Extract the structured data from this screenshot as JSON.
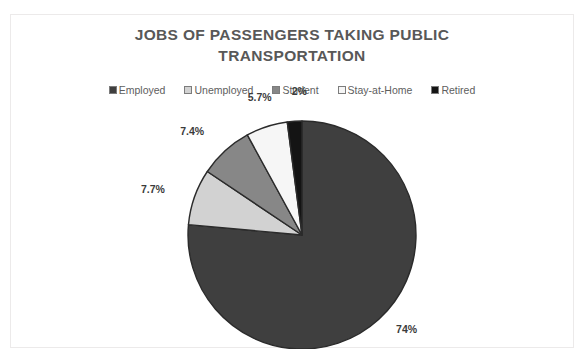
{
  "chart_data": {
    "type": "pie",
    "title": "JOBS OF PASSENGERS TAKING PUBLIC TRANSPORTATION",
    "title_line1": "JOBS OF PASSENGERS TAKING PUBLIC",
    "title_line2": "TRANSPORTATION",
    "xlabel": "",
    "ylabel": "",
    "legend_position": "top",
    "grid": false,
    "categories": [
      "Employed",
      "Unemployed",
      "Student",
      "Stay-at-Home",
      "Retired"
    ],
    "values": [
      74,
      7.7,
      7.4,
      5.7,
      2
    ],
    "labels": [
      "74%",
      "7.7%",
      "7.4%",
      "5.7%",
      "2%"
    ],
    "colors": [
      "#3f3f3f",
      "#d2d2d2",
      "#878787",
      "#f6f6f6",
      "#141414"
    ],
    "slice_border_color": "#2b2b2b",
    "start_angle_deg": 0,
    "direction": "clockwise"
  },
  "chart": {
    "title_line1": "JOBS OF PASSENGERS TAKING PUBLIC",
    "title_line2": "TRANSPORTATION",
    "legend": [
      {
        "label": "Employed",
        "color": "#3f3f3f"
      },
      {
        "label": "Unemployed",
        "color": "#d2d2d2"
      },
      {
        "label": "Student",
        "color": "#878787"
      },
      {
        "label": "Stay-at-Home",
        "color": "#f6f6f6"
      },
      {
        "label": "Retired",
        "color": "#141414"
      }
    ],
    "data_labels": {
      "employed": "74%",
      "unemployed": "7.7%",
      "student": "7.4%",
      "stay_at_home": "5.7%",
      "retired": "2%"
    }
  },
  "theme": {
    "title_color": "#585858",
    "legend_text_color": "#5e5e5e",
    "data_label_color": "#3b3b3b",
    "frame_border_color": "#eceaea",
    "background": "#ffffff"
  }
}
